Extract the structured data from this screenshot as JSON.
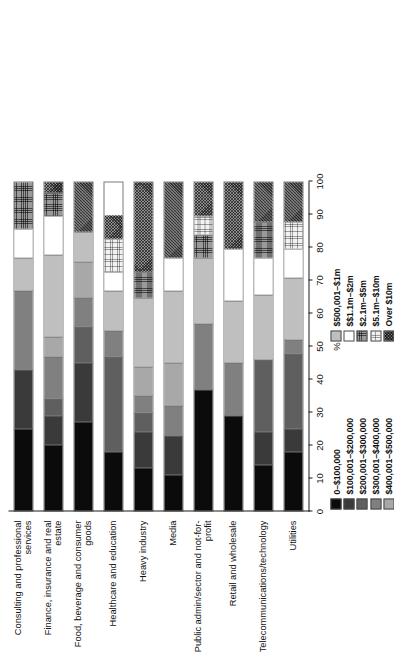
{
  "chart_data": {
    "type": "bar",
    "orientation": "horizontal-stacked-100",
    "title": "",
    "xlabel": "%",
    "ylabel": "",
    "xlim": [
      0,
      100
    ],
    "grid": false,
    "legend_position": "below-plot",
    "tick_labels": [
      "0",
      "10",
      "20",
      "30",
      "40",
      "50",
      "60",
      "70",
      "80",
      "90",
      "100"
    ],
    "tick_values": [
      0,
      10,
      20,
      30,
      40,
      50,
      60,
      70,
      80,
      90,
      100
    ],
    "categories": [
      "Consulting and professional services",
      "Finance, insurance and real estate",
      "Food, beverage and consumer goods",
      "Healthcare and education",
      "Heavy industry",
      "Media",
      "Public admin/sector and not-for-profit",
      "Retail and wholesale",
      "Telecommunications/technology",
      "Utilities"
    ],
    "series": [
      {
        "name": "0–$100,000",
        "values": [
          25,
          20,
          27,
          18,
          13,
          11,
          37,
          29,
          14,
          18
        ]
      },
      {
        "name": "$100,001–$200,000",
        "values": [
          18,
          9,
          18,
          0,
          11,
          12,
          0,
          0,
          10,
          7
        ]
      },
      {
        "name": "$200,001–$300,000",
        "values": [
          0,
          5,
          11,
          29,
          6,
          0,
          0,
          0,
          22,
          23
        ]
      },
      {
        "name": "$300,001–$400,000",
        "values": [
          24,
          13,
          9,
          8,
          5,
          9,
          20,
          16,
          0,
          4
        ]
      },
      {
        "name": "$400,001–$500,000",
        "values": [
          0,
          6,
          11,
          0,
          9,
          13,
          0,
          0,
          0,
          0
        ]
      },
      {
        "name": "$500,001–$1m",
        "values": [
          10,
          25,
          9,
          12,
          21,
          22,
          20,
          19,
          20,
          19
        ]
      },
      {
        "name": "$$1.1m–$2m",
        "values": [
          9,
          12,
          0,
          6,
          0,
          10,
          0,
          16,
          11,
          9
        ]
      },
      {
        "name": "$2.1m–$5m",
        "values": [
          14,
          7,
          0,
          0,
          8,
          0,
          7,
          0,
          11,
          0
        ]
      },
      {
        "name": "$5.1m–$10m",
        "values": [
          0,
          0,
          0,
          10,
          0,
          0,
          6,
          0,
          0,
          8
        ]
      },
      {
        "name": "Over $10m",
        "values": [
          0,
          3,
          15,
          7,
          27,
          23,
          10,
          20,
          12,
          12
        ]
      }
    ]
  },
  "legend_left": {
    "items": [
      {
        "label": "0–$100,000",
        "swatch": "swatch-black"
      },
      {
        "label": "$100,001–$200,000",
        "swatch": "swatch-dark-grey"
      },
      {
        "label": "$200,001–$300,000",
        "swatch": "swatch-mid-grey"
      },
      {
        "label": "$300,001–$400,000",
        "swatch": "swatch-grey"
      },
      {
        "label": "$400,001–$500,000",
        "swatch": "swatch-light-grey"
      }
    ]
  },
  "legend_right": {
    "items": [
      {
        "label": "$500,001–$1m",
        "swatch": "swatch-pale-grey"
      },
      {
        "label": "$$1.1m–$2m",
        "swatch": "swatch-white"
      },
      {
        "label": "$2.1m–$5m",
        "swatch": "swatch-grid-dark"
      },
      {
        "label": "$5.1m–$10m",
        "swatch": "swatch-grid-light"
      },
      {
        "label": "Over $10m",
        "swatch": "swatch-crosshatch"
      }
    ]
  },
  "axis": {
    "x_title": "%"
  },
  "caption": {
    "text": ""
  },
  "colors": {
    "s0": "#0b0b0b",
    "s1": "#3a3a3a",
    "s2": "#5f5f5f",
    "s3": "#808080",
    "s4": "#a8a8a8",
    "s5": "#bfbfbf",
    "s6": "#ffffff",
    "s7": "#9a9a9a",
    "s8": "#f2f2f2",
    "s9": "#8f8f8f",
    "axis": "#1a1a1a",
    "text": "#111111",
    "page_bg": "#ffffff"
  }
}
